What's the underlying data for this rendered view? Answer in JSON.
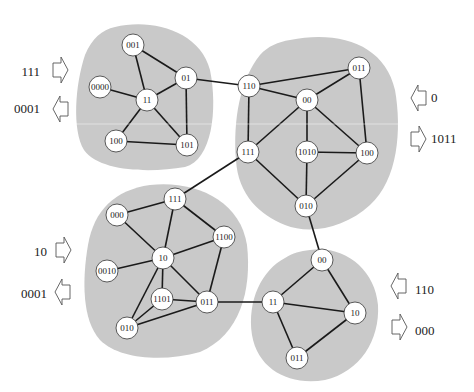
{
  "diagram": {
    "type": "clustered-graph",
    "colors": {
      "background": "#ffffff",
      "cluster_fill": "#c9c9c9",
      "node_fill": "#ffffff",
      "node_stroke": "#333333",
      "edge": "#1a1a1a",
      "arrow_stroke": "#555555",
      "text": "#222222"
    },
    "clusters": [
      {
        "id": "top-left",
        "path": "M 115 27 C 150 18 200 30 210 70 C 218 110 212 160 185 167 C 150 173 100 172 84 150 C 72 130 75 85 85 55 C 92 38 102 30 115 27 Z",
        "nodes": [
          {
            "id": "tl-001",
            "label": "001",
            "x": 133,
            "y": 45
          },
          {
            "id": "tl-01",
            "label": "01",
            "x": 186,
            "y": 78
          },
          {
            "id": "tl-0000",
            "label": "0000",
            "x": 100,
            "y": 87
          },
          {
            "id": "tl-11",
            "label": "11",
            "x": 147,
            "y": 100
          },
          {
            "id": "tl-100",
            "label": "100",
            "x": 116,
            "y": 141
          },
          {
            "id": "tl-101",
            "label": "101",
            "x": 187,
            "y": 145
          }
        ],
        "edges": [
          [
            "tl-001",
            "tl-01"
          ],
          [
            "tl-001",
            "tl-11"
          ],
          [
            "tl-0000",
            "tl-11"
          ],
          [
            "tl-11",
            "tl-01"
          ],
          [
            "tl-01",
            "tl-101"
          ],
          [
            "tl-11",
            "tl-100"
          ],
          [
            "tl-11",
            "tl-101"
          ],
          [
            "tl-100",
            "tl-101"
          ]
        ],
        "inputs": [
          {
            "label": "111",
            "direction": "in",
            "side": "left",
            "text_x": 40,
            "text_y": 76,
            "arrow_x": 53,
            "arrow_y": 57
          }
        ],
        "outputs": [
          {
            "label": "0001",
            "direction": "out",
            "side": "left",
            "text_x": 40,
            "text_y": 113,
            "arrow_x": 53,
            "arrow_y": 96
          }
        ]
      },
      {
        "id": "top-right",
        "path": "M 290 40 C 340 30 385 45 395 90 C 402 130 398 180 370 205 C 345 228 310 235 285 225 C 260 215 238 195 236 160 C 233 120 240 80 260 55 C 268 46 278 42 290 40 Z",
        "nodes": [
          {
            "id": "tr-110",
            "label": "110",
            "x": 249,
            "y": 86
          },
          {
            "id": "tr-011",
            "label": "011",
            "x": 359,
            "y": 68
          },
          {
            "id": "tr-00",
            "label": "00",
            "x": 307,
            "y": 100
          },
          {
            "id": "tr-111",
            "label": "111",
            "x": 248,
            "y": 152
          },
          {
            "id": "tr-1010",
            "label": "1010",
            "x": 307,
            "y": 152
          },
          {
            "id": "tr-100",
            "label": "100",
            "x": 367,
            "y": 153
          },
          {
            "id": "tr-010",
            "label": "010",
            "x": 306,
            "y": 206
          }
        ],
        "edges": [
          [
            "tr-110",
            "tr-011"
          ],
          [
            "tr-110",
            "tr-00"
          ],
          [
            "tr-011",
            "tr-00"
          ],
          [
            "tr-011",
            "tr-100"
          ],
          [
            "tr-110",
            "tr-111"
          ],
          [
            "tr-00",
            "tr-111"
          ],
          [
            "tr-00",
            "tr-1010"
          ],
          [
            "tr-00",
            "tr-100"
          ],
          [
            "tr-1010",
            "tr-100"
          ],
          [
            "tr-1010",
            "tr-010"
          ],
          [
            "tr-111",
            "tr-010"
          ],
          [
            "tr-100",
            "tr-010"
          ]
        ],
        "inputs": [
          {
            "label": "1011",
            "direction": "in",
            "side": "right",
            "text_x": 431,
            "text_y": 143,
            "arrow_x": 411,
            "arrow_y": 126
          }
        ],
        "outputs": [
          {
            "label": "0",
            "direction": "out",
            "side": "right",
            "text_x": 431,
            "text_y": 102,
            "arrow_x": 411,
            "arrow_y": 85
          }
        ]
      },
      {
        "id": "bottom-left",
        "path": "M 150 185 C 195 180 240 200 247 245 C 252 290 240 335 200 352 C 165 362 120 360 100 340 C 82 320 82 280 88 245 C 94 210 115 190 150 185 Z",
        "nodes": [
          {
            "id": "bl-111",
            "label": "111",
            "x": 175,
            "y": 199
          },
          {
            "id": "bl-000",
            "label": "000",
            "x": 117,
            "y": 215
          },
          {
            "id": "bl-1100",
            "label": "1100",
            "x": 224,
            "y": 237
          },
          {
            "id": "bl-10",
            "label": "10",
            "x": 163,
            "y": 258
          },
          {
            "id": "bl-0010",
            "label": "0010",
            "x": 107,
            "y": 271
          },
          {
            "id": "bl-1101",
            "label": "1101",
            "x": 162,
            "y": 299
          },
          {
            "id": "bl-011",
            "label": "011",
            "x": 207,
            "y": 302
          },
          {
            "id": "bl-010",
            "label": "010",
            "x": 127,
            "y": 328
          }
        ],
        "edges": [
          [
            "bl-000",
            "bl-111"
          ],
          [
            "bl-111",
            "bl-10"
          ],
          [
            "bl-111",
            "bl-1100"
          ],
          [
            "bl-000",
            "bl-10"
          ],
          [
            "bl-10",
            "bl-1100"
          ],
          [
            "bl-10",
            "bl-0010"
          ],
          [
            "bl-1100",
            "bl-011"
          ],
          [
            "bl-10",
            "bl-1101"
          ],
          [
            "bl-10",
            "bl-011"
          ],
          [
            "bl-10",
            "bl-010"
          ],
          [
            "bl-1101",
            "bl-011"
          ],
          [
            "bl-1101",
            "bl-010"
          ],
          [
            "bl-011",
            "bl-010"
          ]
        ],
        "inputs": [
          {
            "label": "10",
            "direction": "in",
            "side": "left",
            "text_x": 47,
            "text_y": 256,
            "arrow_x": 56,
            "arrow_y": 237
          }
        ],
        "outputs": [
          {
            "label": "0001",
            "direction": "out",
            "side": "left",
            "text_x": 47,
            "text_y": 298,
            "arrow_x": 55,
            "arrow_y": 279
          }
        ]
      },
      {
        "id": "bottom-right",
        "path": "M 310 250 C 345 245 375 270 378 305 C 380 340 360 372 325 380 C 290 386 258 370 252 335 C 247 300 262 270 285 258 C 293 253 300 251 310 250 Z",
        "nodes": [
          {
            "id": "br-00",
            "label": "00",
            "x": 322,
            "y": 260
          },
          {
            "id": "br-11",
            "label": "11",
            "x": 273,
            "y": 302
          },
          {
            "id": "br-10",
            "label": "10",
            "x": 355,
            "y": 313
          },
          {
            "id": "br-011",
            "label": "011",
            "x": 297,
            "y": 358
          }
        ],
        "edges": [
          [
            "br-00",
            "br-11"
          ],
          [
            "br-00",
            "br-10"
          ],
          [
            "br-11",
            "br-10"
          ],
          [
            "br-11",
            "br-011"
          ],
          [
            "br-10",
            "br-011"
          ]
        ],
        "inputs": [
          {
            "label": "000",
            "direction": "in",
            "side": "right",
            "text_x": 415,
            "text_y": 335,
            "arrow_x": 392,
            "arrow_y": 314
          }
        ],
        "outputs": [
          {
            "label": "110",
            "direction": "out",
            "side": "right",
            "text_x": 415,
            "text_y": 294,
            "arrow_x": 391,
            "arrow_y": 273
          }
        ]
      }
    ],
    "inter_cluster_edges": [
      [
        "tl-01",
        "tr-110"
      ],
      [
        "tr-111",
        "bl-111"
      ],
      [
        "tr-010",
        "br-00"
      ],
      [
        "bl-011",
        "br-11"
      ]
    ]
  }
}
